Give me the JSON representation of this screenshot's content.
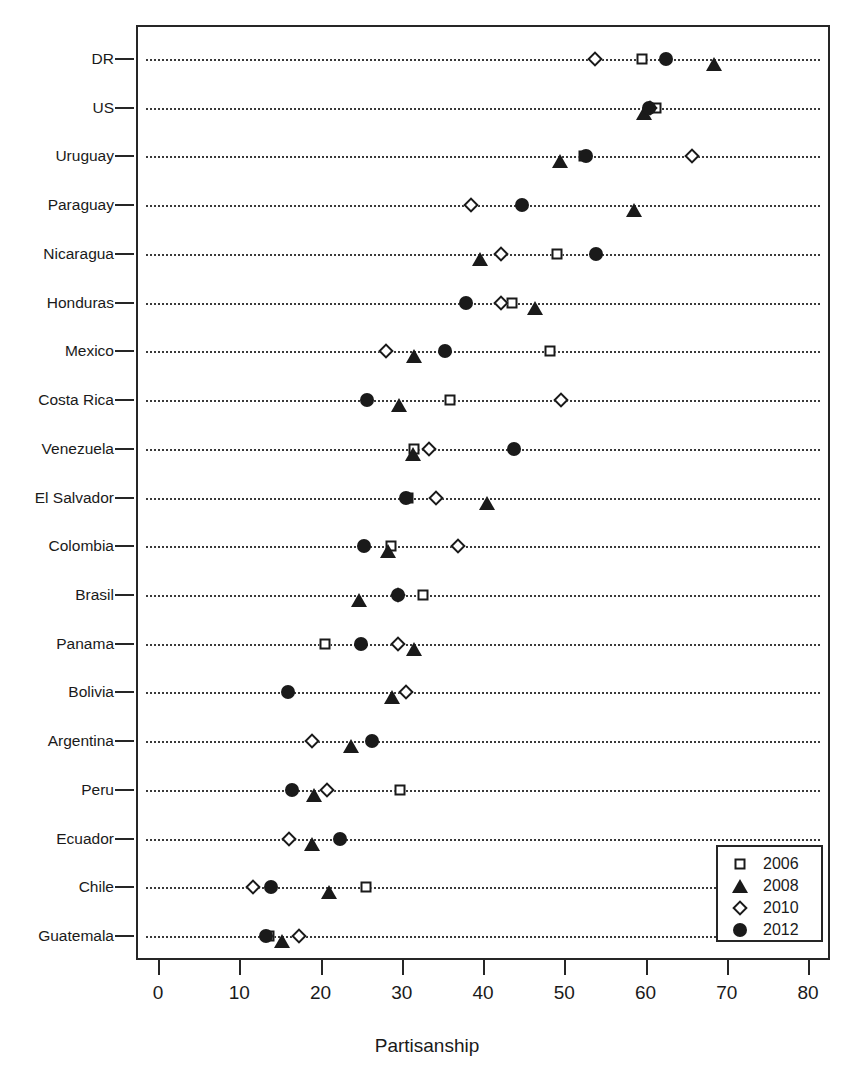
{
  "chart_data": {
    "type": "scatter",
    "title": "",
    "xlabel": "Partisanship",
    "ylabel": "",
    "xlim": [
      0,
      80
    ],
    "xticks": [
      0,
      10,
      20,
      30,
      40,
      50,
      60,
      70,
      80
    ],
    "grid": "horizontal-dotted",
    "legend_position": "bottom-right",
    "legend": [
      {
        "name": "2006",
        "marker": "open-square"
      },
      {
        "name": "2008",
        "marker": "filled-triangle"
      },
      {
        "name": "2010",
        "marker": "open-diamond"
      },
      {
        "name": "2012",
        "marker": "filled-circle"
      }
    ],
    "categories": [
      "DR",
      "US",
      "Uruguay",
      "Paraguay",
      "Nicaragua",
      "Honduras",
      "Mexico",
      "Costa Rica",
      "Venezuela",
      "El Salvador",
      "Colombia",
      "Brasil",
      "Panama",
      "Bolivia",
      "Argentina",
      "Peru",
      "Ecuador",
      "Chile",
      "Guatemala"
    ],
    "series": [
      {
        "name": "2006",
        "marker": "open-square",
        "values": [
          59.3,
          61.1,
          52.2,
          null,
          48.8,
          43.3,
          48.0,
          35.7,
          31.3,
          30.5,
          28.4,
          32.4,
          20.3,
          null,
          null,
          29.5,
          null,
          25.3,
          13.4
        ]
      },
      {
        "name": "2008",
        "marker": "filled-triangle",
        "values": [
          68.2,
          59.6,
          49.2,
          58.3,
          39.4,
          46.2,
          31.3,
          29.4,
          31.1,
          40.2,
          28.1,
          24.5,
          31.3,
          28.6,
          23.5,
          19.0,
          18.7,
          20.8,
          15.0
        ]
      },
      {
        "name": "2010",
        "marker": "open-diamond",
        "values": [
          53.5,
          60.3,
          65.5,
          38.3,
          42.0,
          42.0,
          27.8,
          49.4,
          33.1,
          34.0,
          36.7,
          29.3,
          29.3,
          30.3,
          18.7,
          20.5,
          15.9,
          11.5,
          17.1
        ]
      },
      {
        "name": "2012",
        "marker": "filled-circle",
        "values": [
          62.3,
          60.2,
          52.4,
          44.5,
          53.6,
          37.7,
          35.1,
          25.5,
          43.6,
          30.3,
          25.1,
          29.3,
          24.7,
          15.7,
          26.1,
          16.2,
          22.1,
          13.6,
          13.1
        ]
      }
    ]
  }
}
